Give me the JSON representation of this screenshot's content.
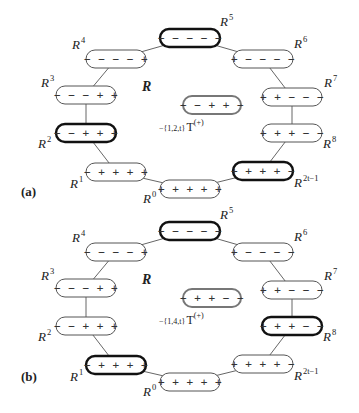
{
  "figure": {
    "set_label": "R",
    "panels": [
      {
        "label": "(a)",
        "transformation": {
          "prefix": "−{1,2,t}",
          "op": "T",
          "sup": "(+)"
        },
        "center_node": "−−++−",
        "nodes": [
          {
            "id": "R0",
            "name": "R",
            "sup": "0",
            "signs": "+++++",
            "bold": false
          },
          {
            "id": "R1",
            "name": "R",
            "sup": "1",
            "signs": "−++++",
            "bold": false
          },
          {
            "id": "R2",
            "name": "R",
            "sup": "2",
            "signs": "−−+++",
            "bold": true
          },
          {
            "id": "R3",
            "name": "R",
            "sup": "3",
            "signs": "−−−++",
            "bold": false
          },
          {
            "id": "R4",
            "name": "R",
            "sup": "4",
            "signs": "−−−−+",
            "bold": false
          },
          {
            "id": "R5",
            "name": "R",
            "sup": "5",
            "signs": "−−−−−",
            "bold": true
          },
          {
            "id": "R6",
            "name": "R",
            "sup": "6",
            "signs": "+−−−−",
            "bold": false
          },
          {
            "id": "R7",
            "name": "R",
            "sup": "7",
            "signs": "++−−−",
            "bold": false
          },
          {
            "id": "R8",
            "name": "R",
            "sup": "8",
            "signs": "+++−−",
            "bold": false
          },
          {
            "id": "R2t-1",
            "name": "R",
            "sup": "2t−1",
            "signs": "++++−",
            "bold": true
          }
        ]
      },
      {
        "label": "(b)",
        "transformation": {
          "prefix": "−{1,4,t}",
          "op": "T",
          "sup": "(+)"
        },
        "center_node": "−++−−",
        "nodes": [
          {
            "id": "R0",
            "name": "R",
            "sup": "0",
            "signs": "+++++",
            "bold": false
          },
          {
            "id": "R1",
            "name": "R",
            "sup": "1",
            "signs": "−++++",
            "bold": true
          },
          {
            "id": "R2",
            "name": "R",
            "sup": "2",
            "signs": "−−+++",
            "bold": false
          },
          {
            "id": "R3",
            "name": "R",
            "sup": "3",
            "signs": "−−−++",
            "bold": false
          },
          {
            "id": "R4",
            "name": "R",
            "sup": "4",
            "signs": "−−−−+",
            "bold": false
          },
          {
            "id": "R5",
            "name": "R",
            "sup": "5",
            "signs": "−−−−−",
            "bold": true
          },
          {
            "id": "R6",
            "name": "R",
            "sup": "6",
            "signs": "+−−−−",
            "bold": false
          },
          {
            "id": "R7",
            "name": "R",
            "sup": "7",
            "signs": "++−−−",
            "bold": false
          },
          {
            "id": "R8",
            "name": "R",
            "sup": "8",
            "signs": "+++−−",
            "bold": true
          },
          {
            "id": "R2t-1",
            "name": "R",
            "sup": "2t−1",
            "signs": "++++−",
            "bold": false
          }
        ]
      }
    ],
    "colors": {
      "line": "#555555",
      "bold_border": "#111111",
      "center_border": "#777777",
      "background": "#ffffff"
    }
  }
}
